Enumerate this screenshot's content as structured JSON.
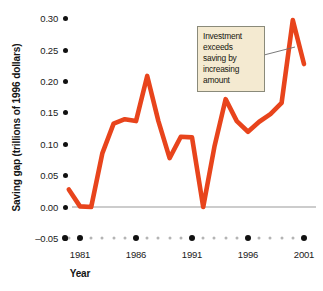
{
  "chart_data": {
    "type": "line",
    "title": "",
    "xlabel": "Year",
    "ylabel": "Saving gap (trillions of 1996 dollars)",
    "xlim": [
      1980,
      2001
    ],
    "ylim": [
      -0.05,
      0.3
    ],
    "grid": false,
    "legend": "none",
    "zero_line": true,
    "line_color": "#e8441c",
    "y_ticks": [
      "0.30",
      "0.25",
      "0.20",
      "0.15",
      "0.10",
      "0.05",
      "0.00",
      "–0.05"
    ],
    "y_tick_values": [
      0.3,
      0.25,
      0.2,
      0.15,
      0.1,
      0.05,
      0.0,
      -0.05
    ],
    "x_ticks": [
      "1981",
      "1986",
      "1991",
      "1996",
      "2001"
    ],
    "x_tick_values": [
      1981,
      1986,
      1991,
      1996,
      2001
    ],
    "x": [
      1980,
      1981,
      1982,
      1983,
      1984,
      1985,
      1986,
      1987,
      1988,
      1989,
      1990,
      1991,
      1992,
      1993,
      1994,
      1995,
      1996,
      1997,
      1998,
      1999,
      2000,
      2001
    ],
    "values": [
      0.028,
      0.001,
      0.0,
      0.086,
      0.133,
      0.14,
      0.137,
      0.209,
      0.137,
      0.078,
      0.112,
      0.111,
      0.0,
      0.096,
      0.172,
      0.137,
      0.12,
      0.136,
      0.148,
      0.166,
      0.298,
      0.228
    ],
    "annotations": [
      {
        "text_lines": [
          "Investment",
          "exceeds",
          "saving by",
          "increasing",
          "amount"
        ],
        "points_to_x": 1999,
        "points_to_y": 0.228
      }
    ]
  },
  "axis": {
    "y_title": "Saving gap (trillions of 1996 dollars)",
    "x_title": "Year"
  },
  "callout": {
    "line1": "Investment",
    "line2": "exceeds",
    "line3": "saving by",
    "line4": "increasing",
    "line5": "amount"
  }
}
